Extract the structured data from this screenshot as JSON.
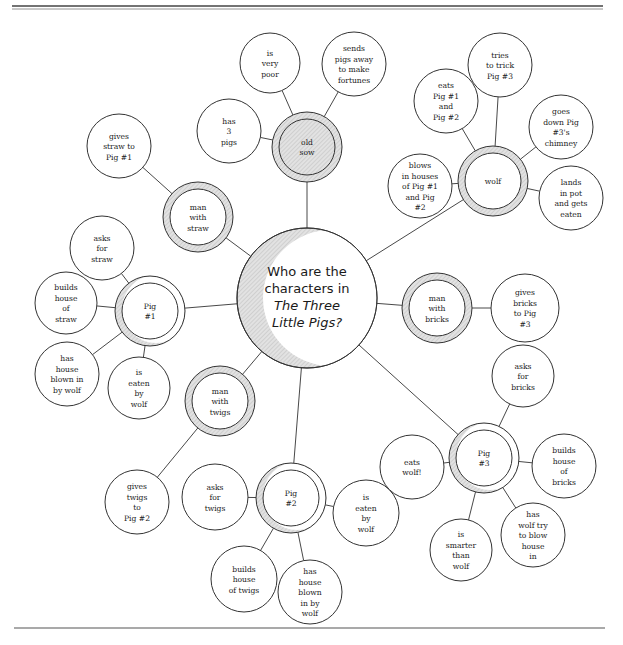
{
  "diagram": {
    "type": "bubble-map",
    "colors": {
      "line": "#333333",
      "shade": "#d0d0d0",
      "background": "#ffffff"
    },
    "center": {
      "id": "center",
      "lines": [
        "Who are the",
        "characters in",
        "The Three",
        "Little Pigs?"
      ],
      "italic_lines": [
        2,
        3
      ],
      "x": 307,
      "y": 298,
      "r": 70
    },
    "characters": [
      {
        "id": "old-sow",
        "lines": [
          "old",
          "sow"
        ],
        "x": 307,
        "y": 147,
        "r": 35,
        "style": "full",
        "details": [
          {
            "lines": [
              "is",
              "very",
              "poor"
            ],
            "x": 270,
            "y": 63,
            "r": 30
          },
          {
            "lines": [
              "sends",
              "pigs away",
              "to make",
              "fortunes"
            ],
            "x": 354,
            "y": 64,
            "r": 32
          },
          {
            "lines": [
              "has",
              "3",
              "pigs"
            ],
            "x": 229,
            "y": 131,
            "r": 32
          }
        ]
      },
      {
        "id": "wolf",
        "lines": [
          "wolf"
        ],
        "x": 493,
        "y": 181,
        "r": 35,
        "style": "ring",
        "details": [
          {
            "lines": [
              "eats",
              "Pig #1",
              "and",
              "Pig #2"
            ],
            "x": 446,
            "y": 101,
            "r": 32
          },
          {
            "lines": [
              "tries",
              "to trick",
              "Pig #3"
            ],
            "x": 500,
            "y": 65,
            "r": 32
          },
          {
            "lines": [
              "goes",
              "down Pig",
              "#3's",
              "chimney"
            ],
            "x": 561,
            "y": 127,
            "r": 32
          },
          {
            "lines": [
              "lands",
              "in pot",
              "and gets",
              "eaten"
            ],
            "x": 571,
            "y": 198,
            "r": 32
          },
          {
            "lines": [
              "blows",
              "in houses",
              "of Pig #1",
              "and Pig",
              "#2"
            ],
            "x": 420,
            "y": 186,
            "r": 32
          }
        ]
      },
      {
        "id": "man-with-straw",
        "lines": [
          "man",
          "with",
          "straw"
        ],
        "x": 198,
        "y": 217,
        "r": 35,
        "style": "ring",
        "details": [
          {
            "lines": [
              "gives",
              "straw to",
              "Pig #1"
            ],
            "x": 119,
            "y": 146,
            "r": 32
          }
        ]
      },
      {
        "id": "pig-1",
        "lines": [
          "Pig",
          "#1"
        ],
        "x": 150,
        "y": 311,
        "r": 35,
        "style": "crescent",
        "details": [
          {
            "lines": [
              "asks",
              "for",
              "straw"
            ],
            "x": 102,
            "y": 248,
            "r": 32
          },
          {
            "lines": [
              "builds",
              "house",
              "of",
              "straw"
            ],
            "x": 66,
            "y": 303,
            "r": 31
          },
          {
            "lines": [
              "has",
              "house",
              "blown in",
              "by wolf"
            ],
            "x": 67,
            "y": 374,
            "r": 32
          },
          {
            "lines": [
              "is",
              "eaten",
              "by",
              "wolf"
            ],
            "x": 139,
            "y": 388,
            "r": 31
          }
        ]
      },
      {
        "id": "man-with-bricks",
        "lines": [
          "man",
          "with",
          "bricks"
        ],
        "x": 437,
        "y": 308,
        "r": 35,
        "style": "ring",
        "details": [
          {
            "lines": [
              "gives",
              "bricks",
              "to Pig",
              "#3"
            ],
            "x": 525,
            "y": 308,
            "r": 34
          }
        ]
      },
      {
        "id": "man-with-twigs",
        "lines": [
          "man",
          "with",
          "twigs"
        ],
        "x": 220,
        "y": 401,
        "r": 35,
        "style": "ring",
        "details": [
          {
            "lines": [
              "gives",
              "twigs",
              "to",
              "Pig #2"
            ],
            "x": 137,
            "y": 502,
            "r": 32
          }
        ]
      },
      {
        "id": "pig-2",
        "lines": [
          "Pig",
          "#2"
        ],
        "x": 291,
        "y": 498,
        "r": 35,
        "style": "crescent",
        "details": [
          {
            "lines": [
              "asks",
              "for",
              "twigs"
            ],
            "x": 215,
            "y": 497,
            "r": 33
          },
          {
            "lines": [
              "is",
              "eaten",
              "by",
              "wolf"
            ],
            "x": 366,
            "y": 513,
            "r": 33
          },
          {
            "lines": [
              "builds",
              "house",
              "of twigs"
            ],
            "x": 244,
            "y": 579,
            "r": 33
          },
          {
            "lines": [
              "has",
              "house",
              "blown",
              "in by",
              "wolf"
            ],
            "x": 310,
            "y": 592,
            "r": 32
          }
        ]
      },
      {
        "id": "pig-3",
        "lines": [
          "Pig",
          "#3"
        ],
        "x": 484,
        "y": 458,
        "r": 35,
        "style": "crescent",
        "details": [
          {
            "lines": [
              "asks",
              "for",
              "bricks"
            ],
            "x": 523,
            "y": 376,
            "r": 31
          },
          {
            "lines": [
              "builds",
              "house",
              "of",
              "bricks"
            ],
            "x": 564,
            "y": 466,
            "r": 32
          },
          {
            "lines": [
              "has",
              "wolf try",
              "to blow",
              "house",
              "in"
            ],
            "x": 533,
            "y": 535,
            "r": 32
          },
          {
            "lines": [
              "eats",
              "wolf!"
            ],
            "x": 412,
            "y": 467,
            "r": 32
          },
          {
            "lines": [
              "is",
              "smarter",
              "than",
              "wolf"
            ],
            "x": 461,
            "y": 550,
            "r": 31
          }
        ]
      }
    ]
  }
}
